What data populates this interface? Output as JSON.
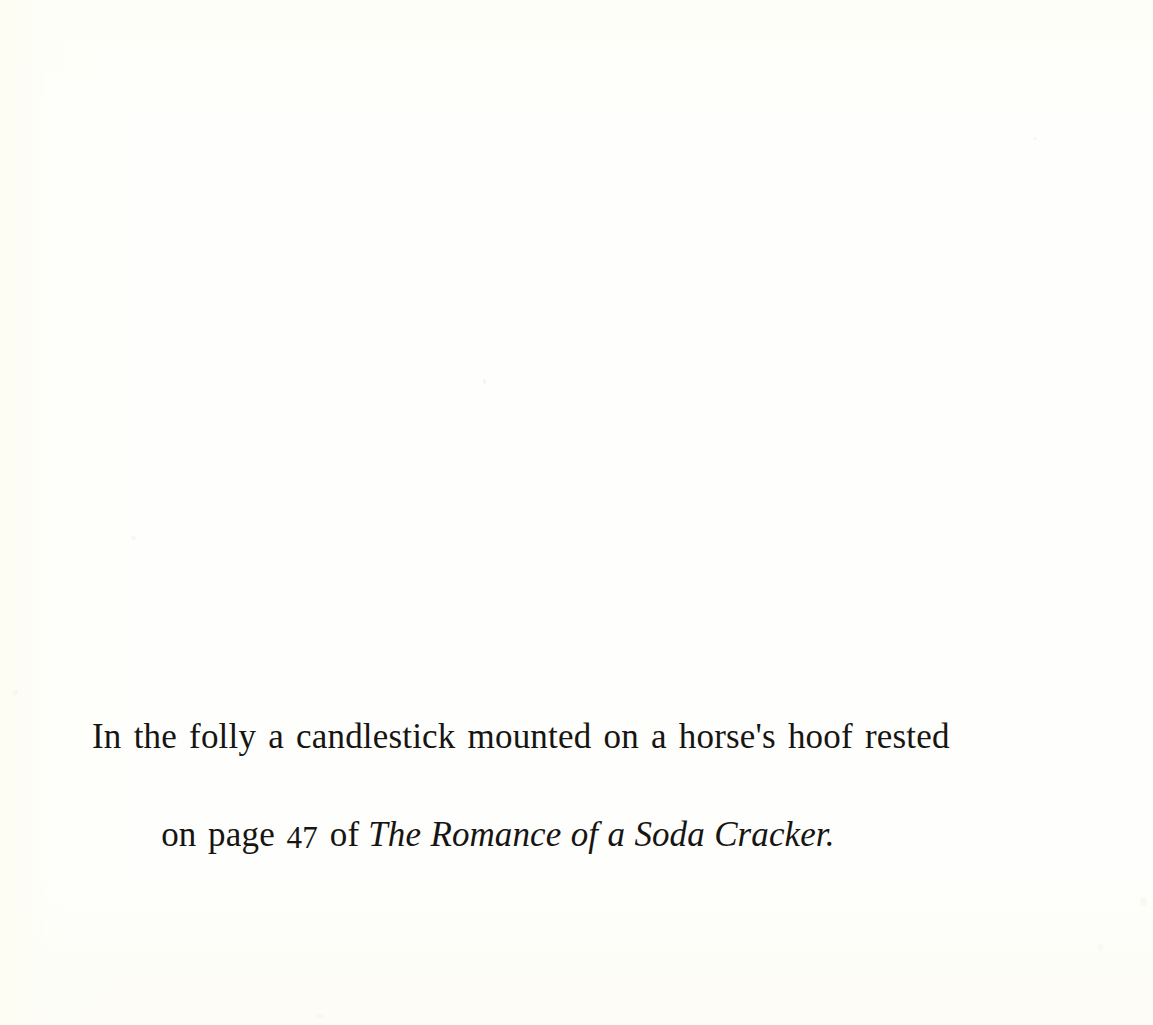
{
  "page": {
    "background_color": "#fefefc",
    "ink_color": "#171512",
    "width": 1153,
    "height": 1025
  },
  "body_text": {
    "line_1": "In the folly a candlestick mounted on a horse's hoof rested",
    "line_2": {
      "before_number": "on page ",
      "page_number": "47",
      "after_number": " of",
      "title_italic": "The Romance of a Soda Cracker.",
      "full_text": "on page 47 of The Romance of a Soda Cracker."
    },
    "full_paragraph": "In the folly a candlestick mounted on a horse's hoof rested on page 47 of The Romance of a Soda Cracker."
  }
}
